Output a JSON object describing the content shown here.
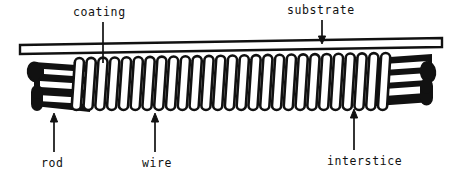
{
  "figure": {
    "background_color": "#ffffff",
    "ink_color": "#111111"
  },
  "labels": {
    "coating": "coating",
    "substrate": "substrate",
    "rod": "rod",
    "wire": "wire",
    "interstice": "interstice"
  },
  "annotations": [
    {
      "name": "coating",
      "text": "coating",
      "leader": "plain-line",
      "direction": "down",
      "from_x": 103,
      "from_y": 22,
      "to_x": 103,
      "to_y": 62
    },
    {
      "name": "substrate",
      "text": "substrate",
      "leader": "arrow",
      "direction": "down",
      "from_x": 322,
      "from_y": 20,
      "to_x": 322,
      "to_y": 44
    },
    {
      "name": "rod",
      "text": "rod",
      "leader": "arrow",
      "direction": "up",
      "from_x": 54,
      "from_y": 152,
      "to_x": 54,
      "to_y": 114
    },
    {
      "name": "wire",
      "text": "wire",
      "leader": "arrow",
      "direction": "up",
      "from_x": 155,
      "from_y": 152,
      "to_x": 155,
      "to_y": 114
    },
    {
      "name": "interstice",
      "text": "interstice",
      "leader": "arrow",
      "direction": "up",
      "from_x": 354,
      "from_y": 150,
      "to_x": 354,
      "to_y": 110
    }
  ],
  "diagram": {
    "substrate_bar": {
      "left_x": 20,
      "right_x": 442,
      "left_y_top": 45,
      "left_y_bottom": 54,
      "right_y_top": 38,
      "right_y_bottom": 47,
      "fill": "#ffffff",
      "stroke": "#111111",
      "stroke_width": 2.2
    },
    "coil": {
      "turns": 27,
      "start_x": 72,
      "end_x": 390,
      "top_y": 59,
      "bottom_y": 110,
      "turn_width": 9.2,
      "slant": 3,
      "fill": "#ffffff",
      "stroke": "#111111",
      "stroke_width": 2.6
    },
    "rod_left": {
      "cap_cx": 35,
      "cap_cy": 72,
      "cap_rx": 7,
      "cap_ry": 9,
      "body_x1": 30,
      "body_x2": 86,
      "body_y_top": 62,
      "body_y_bottom": 108,
      "bands": 3
    },
    "rod_right": {
      "cap_cx": 427,
      "cap_cy": 78,
      "cap_rx": 7,
      "cap_ry": 10,
      "body_x1": 380,
      "body_x2": 432,
      "body_y_top": 58,
      "body_y_bottom": 104,
      "bands": 3
    }
  }
}
